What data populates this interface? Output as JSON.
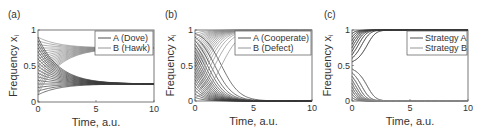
{
  "chart_data": [
    {
      "type": "line",
      "panel_label": "(a)",
      "xlabel": "Time, a.u.",
      "ylabel": "Frequency x",
      "ylabel_subscript": "i",
      "xlim": [
        0,
        10
      ],
      "ylim": [
        0,
        1
      ],
      "xticks": [
        "0",
        "5",
        "10"
      ],
      "yticks": [
        "0",
        "0.5",
        "1"
      ],
      "legend": [
        "A (Dove)",
        "B (Hawk)"
      ],
      "legend_position": "top-right",
      "colors": {
        "A": "#3a3a3a",
        "B": "#8a8a8a"
      },
      "dynamics": "stable-mixed",
      "equilibrium_A": 0.25,
      "rate": 0.55,
      "initial_A": [
        0.1,
        0.15,
        0.2,
        0.25,
        0.3,
        0.35,
        0.4,
        0.45,
        0.5,
        0.55,
        0.6,
        0.65,
        0.7,
        0.75,
        0.8,
        0.85,
        0.9
      ]
    },
    {
      "type": "line",
      "panel_label": "(b)",
      "xlabel": "Time, a.u.",
      "ylabel": "Frequency x",
      "ylabel_subscript": "i",
      "xlim": [
        0,
        10
      ],
      "ylim": [
        0,
        1
      ],
      "xticks": [
        "0",
        "5",
        "10"
      ],
      "yticks": [
        "0",
        "0.5",
        "1"
      ],
      "legend": [
        "A (Cooperate)",
        "B (Defect)"
      ],
      "legend_position": "top-right",
      "colors": {
        "A": "#3a3a3a",
        "B": "#8a8a8a"
      },
      "dynamics": "dominance-B",
      "rate": 1.3,
      "initial_A": [
        0.05,
        0.1,
        0.15,
        0.2,
        0.25,
        0.3,
        0.35,
        0.4,
        0.45,
        0.5,
        0.55,
        0.6,
        0.65,
        0.7,
        0.75,
        0.8,
        0.85,
        0.9,
        0.95
      ]
    },
    {
      "type": "line",
      "panel_label": "(c)",
      "xlabel": "Time, a.u.",
      "ylabel": "Frequency x",
      "ylabel_subscript": "i",
      "xlim": [
        0,
        10
      ],
      "ylim": [
        0,
        1
      ],
      "xticks": [
        "0",
        "5",
        "10"
      ],
      "yticks": [
        "0",
        "0.5",
        "1"
      ],
      "legend": [
        "Strategy A",
        "Strategy B"
      ],
      "legend_position": "top-right",
      "colors": {
        "A": "#3a3a3a",
        "B": "#8a8a8a"
      },
      "dynamics": "bistable",
      "threshold": 0.5,
      "rate": 2.4,
      "initial_A": [
        0.05,
        0.1,
        0.15,
        0.2,
        0.25,
        0.3,
        0.35,
        0.4,
        0.45,
        0.55,
        0.6,
        0.65,
        0.7,
        0.75,
        0.8,
        0.85,
        0.9,
        0.95
      ]
    }
  ]
}
